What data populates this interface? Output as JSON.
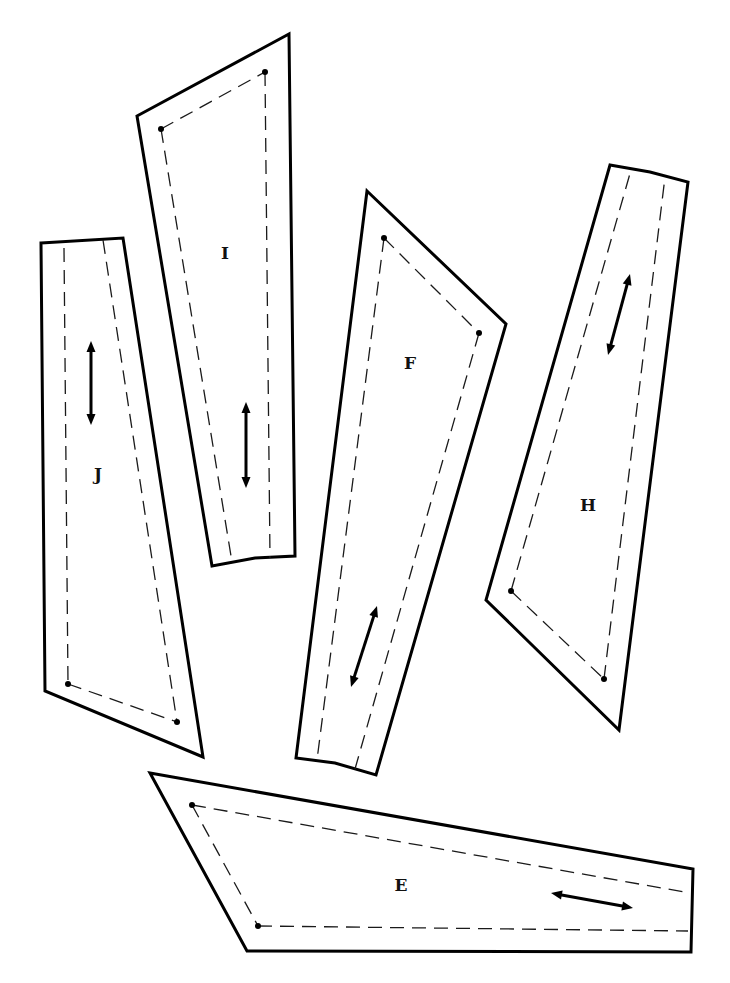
{
  "diagram": {
    "title": "",
    "stroke_color": "#000000",
    "background": "#ffffff"
  },
  "pieces": [
    {
      "label": "I",
      "outline": [
        [
          137,
          116
        ],
        [
          289,
          34
        ],
        [
          295,
          556
        ],
        [
          255,
          558
        ],
        [
          212,
          566
        ]
      ],
      "seams": [
        [
          [
            161,
            129
          ],
          [
            265,
            72
          ]
        ],
        [
          [
            161,
            129
          ],
          [
            232,
            562
          ]
        ],
        [
          [
            265,
            72
          ],
          [
            270,
            558
          ]
        ]
      ],
      "dots": [
        [
          161,
          129
        ],
        [
          265,
          72
        ]
      ],
      "grain": [
        [
          246,
          402
        ],
        [
          246,
          488
        ]
      ],
      "label_pos": [
        225,
        254
      ]
    },
    {
      "label": "J",
      "outline": [
        [
          41,
          243
        ],
        [
          123,
          238
        ],
        [
          203,
          757
        ],
        [
          45,
          691
        ]
      ],
      "seams": [
        [
          [
            64,
            248
          ],
          [
            68,
            684
          ]
        ],
        [
          [
            103,
            240
          ],
          [
            177,
            722
          ]
        ],
        [
          [
            68,
            684
          ],
          [
            177,
            722
          ]
        ]
      ],
      "dots": [
        [
          68,
          684
        ],
        [
          177,
          722
        ]
      ],
      "grain": [
        [
          91,
          341
        ],
        [
          91,
          425
        ]
      ],
      "label_pos": [
        98,
        475
      ]
    },
    {
      "label": "F",
      "outline": [
        [
          367,
          191
        ],
        [
          506,
          324
        ],
        [
          376,
          775
        ],
        [
          335,
          763
        ],
        [
          296,
          758
        ]
      ],
      "seams": [
        [
          [
            384,
            238
          ],
          [
            479,
            333
          ]
        ],
        [
          [
            384,
            238
          ],
          [
            317,
            760
          ]
        ],
        [
          [
            479,
            333
          ],
          [
            355,
            769
          ]
        ]
      ],
      "dots": [
        [
          384,
          238
        ],
        [
          479,
          333
        ]
      ],
      "grain": [
        [
          377,
          606
        ],
        [
          351,
          687
        ]
      ],
      "label_pos": [
        410,
        364
      ]
    },
    {
      "label": "H",
      "outline": [
        [
          610,
          165
        ],
        [
          650,
          172
        ],
        [
          688,
          182
        ],
        [
          619,
          730
        ],
        [
          486,
          600
        ]
      ],
      "seams": [
        [
          [
            511,
            591
          ],
          [
            604,
            679
          ]
        ],
        [
          [
            511,
            591
          ],
          [
            631,
            170
          ]
        ],
        [
          [
            604,
            679
          ],
          [
            665,
            177
          ]
        ]
      ],
      "dots": [
        [
          511,
          591
        ],
        [
          604,
          679
        ]
      ],
      "grain": [
        [
          630,
          274
        ],
        [
          608,
          355
        ]
      ],
      "label_pos": [
        588,
        506
      ]
    },
    {
      "label": "E",
      "outline": [
        [
          150,
          773
        ],
        [
          693,
          869
        ],
        [
          691,
          952
        ],
        [
          247,
          951
        ]
      ],
      "seams": [
        [
          [
            192,
            805
          ],
          [
            690,
            893
          ]
        ],
        [
          [
            192,
            805
          ],
          [
            258,
            926
          ]
        ],
        [
          [
            258,
            926
          ],
          [
            688,
            931
          ]
        ]
      ],
      "dots": [
        [
          192,
          805
        ],
        [
          258,
          926
        ]
      ],
      "grain": [
        [
          551,
          893
        ],
        [
          633,
          908
        ]
      ],
      "label_pos": [
        401,
        886
      ]
    }
  ],
  "legend": {
    "cut_line": "cutting line (solid)",
    "seam_line": "seam line (dashed)",
    "grain_arrow": "grain line (double arrow)",
    "dot": "matching point"
  }
}
